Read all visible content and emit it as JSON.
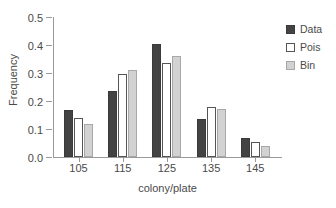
{
  "chart_data": {
    "type": "bar",
    "title": "",
    "xlabel": "colony/plate",
    "ylabel": "Frequency",
    "categories": [
      "105",
      "115",
      "125",
      "135",
      "145"
    ],
    "series": [
      {
        "name": "Data",
        "color": "#434343",
        "values": [
          0.167,
          0.235,
          0.402,
          0.135,
          0.068
        ]
      },
      {
        "name": "Pois",
        "color": "#ffffff",
        "values": [
          0.141,
          0.298,
          0.334,
          0.177,
          0.053
        ]
      },
      {
        "name": "Bin",
        "color": "#d2d2d2",
        "values": [
          0.119,
          0.312,
          0.361,
          0.172,
          0.041
        ]
      }
    ],
    "ylim": [
      0.0,
      0.5
    ],
    "ytick_labels": [
      "0.0",
      "0.1",
      "0.2",
      "0.3",
      "0.4",
      "0.5"
    ],
    "ytick_values": [
      0.0,
      0.1,
      0.2,
      0.3,
      0.4,
      0.5
    ],
    "grid": false,
    "legend_position": "right",
    "legend_frame": false
  }
}
